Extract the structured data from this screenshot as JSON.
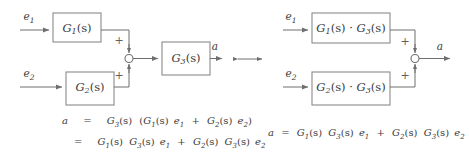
{
  "figure": {
    "equivalence_symbol": "left-right-arrow"
  },
  "left_diagram": {
    "name": "original-block-diagram",
    "inputs": [
      {
        "id": "e1",
        "label": "e",
        "sub": "1"
      },
      {
        "id": "e2",
        "label": "e",
        "sub": "2"
      }
    ],
    "blocks": [
      {
        "id": "G1",
        "label": "G",
        "sub": "1",
        "arg": "(s)",
        "full": "G1(s)"
      },
      {
        "id": "G2",
        "label": "G",
        "sub": "2",
        "arg": "(s)",
        "full": "G2(s)"
      },
      {
        "id": "G3",
        "label": "G",
        "sub": "3",
        "arg": "(s)",
        "full": "G3(s)"
      }
    ],
    "sum_junction": {
      "name": "summing-junction",
      "signs": [
        "+",
        "+"
      ]
    },
    "output": {
      "id": "a",
      "label": "a"
    }
  },
  "right_diagram": {
    "name": "equivalent-block-diagram",
    "inputs": [
      {
        "id": "e1",
        "label": "e",
        "sub": "1"
      },
      {
        "id": "e2",
        "label": "e",
        "sub": "2"
      }
    ],
    "blocks": [
      {
        "id": "G1G3",
        "label1": "G",
        "sub1": "1",
        "dot": "·",
        "label2": "G",
        "sub2": "3",
        "full": "G1(s) · G3(s)"
      },
      {
        "id": "G2G3",
        "label1": "G",
        "sub1": "2",
        "dot": "·",
        "label2": "G",
        "sub2": "3",
        "full": "G2(s) · G3(s)"
      }
    ],
    "sum_junction": {
      "name": "summing-junction",
      "signs": [
        "+",
        "+"
      ]
    },
    "output": {
      "id": "a",
      "label": "a"
    }
  },
  "equations": {
    "left": [
      {
        "lhs": "a",
        "rel": "=",
        "rhs": "G3(s) (G1(s) e1 + G2(s) e2)"
      },
      {
        "lhs": "",
        "rel": "=",
        "rhs": "G1(s) G3(s) e1 + G2(s) G3(s) e2"
      }
    ],
    "right": [
      {
        "lhs": "a",
        "rel": "=",
        "rhs": "G1(s) G3(s) e1 + G2(s) G3(s) e2"
      }
    ]
  },
  "colors": {
    "background": "#ffffff",
    "box_stroke": "#8a8a8a",
    "wire": "#6f6f6f",
    "text": "#3b3b3b"
  }
}
